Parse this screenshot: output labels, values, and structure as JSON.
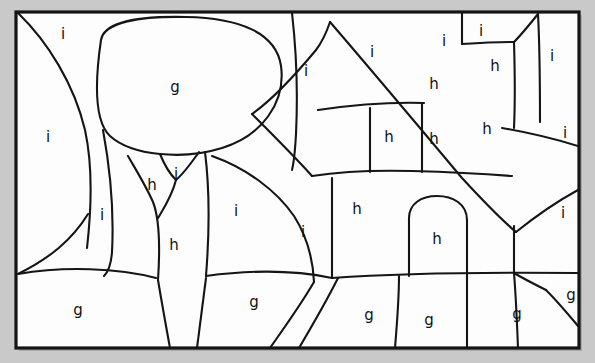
{
  "figure": {
    "kind": "hand-drawn region segmentation sketch",
    "background_color": "#c9c9c9",
    "paper_color": "#fdfdfd",
    "ink_color": "#151515",
    "frame": {
      "x": 16,
      "y": 12,
      "width": 563,
      "height": 336
    }
  },
  "legend_letters": {
    "g": "g",
    "h": "h",
    "i": "i"
  },
  "regions": [
    {
      "id": "r01",
      "label": "i",
      "x": 63,
      "y": 34
    },
    {
      "id": "r02",
      "label": "g",
      "x": 175,
      "y": 87
    },
    {
      "id": "r03",
      "label": "i",
      "x": 306,
      "y": 71
    },
    {
      "id": "r04",
      "label": "i",
      "x": 372,
      "y": 52
    },
    {
      "id": "r05",
      "label": "i",
      "x": 444,
      "y": 41
    },
    {
      "id": "r06",
      "label": "i",
      "x": 481,
      "y": 31
    },
    {
      "id": "r07",
      "label": "h",
      "x": 495,
      "y": 66
    },
    {
      "id": "r08",
      "label": "i",
      "x": 552,
      "y": 56
    },
    {
      "id": "r09",
      "label": "i",
      "x": 48,
      "y": 137
    },
    {
      "id": "r10",
      "label": "h",
      "x": 434,
      "y": 84
    },
    {
      "id": "r11",
      "label": "h",
      "x": 389,
      "y": 137
    },
    {
      "id": "r12",
      "label": "h",
      "x": 434,
      "y": 139
    },
    {
      "id": "r13",
      "label": "h",
      "x": 487,
      "y": 129
    },
    {
      "id": "r14",
      "label": "i",
      "x": 565,
      "y": 133
    },
    {
      "id": "r15",
      "label": "h",
      "x": 152,
      "y": 185
    },
    {
      "id": "r16",
      "label": "i",
      "x": 174,
      "y": 176
    },
    {
      "id": "r17",
      "label": "i",
      "x": 102,
      "y": 215
    },
    {
      "id": "r18",
      "label": "i",
      "x": 236,
      "y": 211
    },
    {
      "id": "r19",
      "label": "i",
      "x": 303,
      "y": 232
    },
    {
      "id": "r20",
      "label": "h",
      "x": 357,
      "y": 209
    },
    {
      "id": "r21",
      "label": "h",
      "x": 437,
      "y": 239
    },
    {
      "id": "r22",
      "label": "i",
      "x": 563,
      "y": 213
    },
    {
      "id": "r23",
      "label": "h",
      "x": 174,
      "y": 245
    },
    {
      "id": "r24",
      "label": "g",
      "x": 78,
      "y": 310
    },
    {
      "id": "r25",
      "label": "g",
      "x": 254,
      "y": 302
    },
    {
      "id": "r26",
      "label": "g",
      "x": 369,
      "y": 315
    },
    {
      "id": "r27",
      "label": "g",
      "x": 429,
      "y": 320
    },
    {
      "id": "r28",
      "label": "g",
      "x": 517,
      "y": 314
    },
    {
      "id": "r29",
      "label": "g",
      "x": 571,
      "y": 295
    }
  ],
  "label_counts": {
    "g": 6,
    "h": 9,
    "i": 14,
    "total": 29
  },
  "strokes": {
    "frame_border": "M16,12 L579,12 L579,348 L16,348 Z",
    "sky_left_curve": "M18,14 C46,42 72,82 83,128 C90,160 90,200 86,245",
    "canopy_ellipse": "M99,36 C99,18 135,16 180,16 C232,16 272,28 279,60 C287,96 268,132 230,147 C190,162 138,158 113,138 C94,122 92,78 99,36 Z",
    "trunk_left": "M118,152 C128,170 138,190 146,208 C152,230 152,262 150,284",
    "trunk_notch_left": "M140,152 C146,166 156,176 166,180",
    "trunk_notch_right": "M190,152 C184,162 174,174 166,180",
    "trunk_right": "M196,152 C200,180 200,216 198,270",
    "tree_v_stem": "M166,180 C164,196 160,212 156,228",
    "left_ground_line": "M18,272 C66,264 116,266 152,276",
    "lower_left_sky": "M18,272 C52,254 72,236 86,212",
    "mid_big_curve": "M202,156 C236,168 268,188 288,214 C304,236 310,258 312,282",
    "mid_left_curve": "M204,158 C206,196 206,238 206,278",
    "ground_line_mid": "M198,272 C246,266 292,268 330,276",
    "ground_line_main": "M330,276 C400,272 480,272 579,272",
    "house_vert_1": "M330,176 L330,276",
    "house_wall_curve": "M312,174 C332,172 358,170 390,170",
    "roof_left_diag": "M312,170 C296,152 272,130 250,112",
    "roof_big_diag": "M330,26 C372,74 428,140 514,214",
    "roof_small_diag": "M248,112 C268,102 290,94 312,86",
    "sky_sep_1": "M290,14 C294,50 296,96 294,140",
    "sky_sep_2": "M250,112 C268,96 292,70 314,44",
    "house_upper_band": "M316,106 C352,102 396,100 436,102",
    "house_mid_vert_a": "M368,104 L368,166",
    "house_mid_vert_b": "M420,102 L420,170",
    "attic_box_left": "M458,16 L458,42",
    "attic_box_top": "M458,42 L512,40",
    "attic_box_right": "M512,40 L512,126",
    "attic_roof": "M512,40 L536,16",
    "right_wall_vert": "M536,16 C538,60 538,96 538,120",
    "right_diag_1": "M514,214 C534,200 556,186 579,176",
    "right_diag_2": "M500,126 C524,130 552,136 579,142",
    "right_vert_low": "M510,212 L512,272",
    "door_arch": "M409,278 L409,216 C409,200 424,194 437,194 C452,194 466,202 466,218 L466,278",
    "door_vert_left": "M409,278 L409,216",
    "lower_vert_1": "M398,276 C398,300 396,326 394,348",
    "lower_vert_2": "M466,276 L466,348",
    "lower_diag_1": "M312,282 C298,306 282,328 268,348",
    "lower_diag_2": "M336,276 C324,300 310,326 296,348",
    "lower_right_vert": "M512,272 L514,348",
    "corner_diag_low": "M544,290 L579,328",
    "corner_diag_low2": "M514,272 C528,280 540,288 552,294",
    "ground_left_drop": "M152,276 C158,302 164,326 170,348",
    "lower_mid_vert": "M206,278 C204,302 200,326 196,348"
  }
}
